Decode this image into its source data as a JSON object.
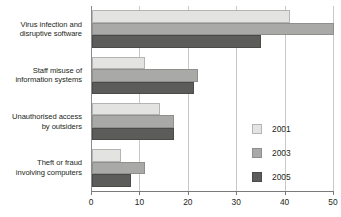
{
  "chart_data": {
    "type": "bar",
    "orientation": "horizontal",
    "title": "",
    "subtitle": "",
    "xlabel": "",
    "ylabel": "",
    "xlim": [
      0,
      50
    ],
    "xticks": [
      0,
      10,
      20,
      30,
      40,
      50
    ],
    "xtick_labels": [
      "0",
      "10",
      "20",
      "30",
      "40",
      "50"
    ],
    "grid": true,
    "grid_axis": "x",
    "legend_position": "right-inside",
    "categories": [
      "Virus infection and disruptive software",
      "Staff misuse of information systems",
      "Unauthorised access by outsiders",
      "Theft or fraud involving computers"
    ],
    "category_lines": [
      [
        "Virus infection and",
        "disruptive software"
      ],
      [
        "Staff misuse of",
        "information systems"
      ],
      [
        "Unauthorised access",
        "by outsiders"
      ],
      [
        "Theft or fraud",
        "involving computers"
      ]
    ],
    "series": [
      {
        "name": "2001",
        "color": "#e3e3e1",
        "values": [
          41,
          11,
          14,
          6
        ]
      },
      {
        "name": "2003",
        "color": "#a9a9a7",
        "values": [
          50,
          22,
          17,
          11
        ]
      },
      {
        "name": "2005",
        "color": "#5c5c5a",
        "values": [
          35,
          21,
          17,
          8
        ]
      }
    ]
  },
  "legend": {
    "items": [
      {
        "label": "2001",
        "color": "#e3e3e1"
      },
      {
        "label": "2003",
        "color": "#a9a9a7"
      },
      {
        "label": "2005",
        "color": "#5c5c5a"
      }
    ]
  },
  "colors": {
    "series_2001": "#e3e3e1",
    "series_2003": "#a9a9a7",
    "series_2005": "#5c5c5a",
    "gridline": "#c9c9c9",
    "axis": "#7a7a7a",
    "text": "#231f20",
    "background": "#ffffff"
  }
}
